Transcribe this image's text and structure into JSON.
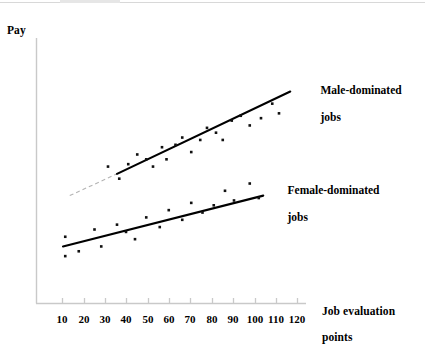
{
  "figure": {
    "y_axis_label": "Pay",
    "x_axis_title_line1": "Job evaluation",
    "x_axis_title_line2": "points"
  },
  "series_labels": {
    "male_line1": "Male-dominated",
    "male_line2": "jobs",
    "female_line1": "Female-dominated",
    "female_line2": "jobs"
  },
  "ticks": [
    {
      "label": "10",
      "x": 62
    },
    {
      "label": "20",
      "x": 84
    },
    {
      "label": "30",
      "x": 105
    },
    {
      "label": "40",
      "x": 126
    },
    {
      "label": "50",
      "x": 148
    },
    {
      "label": "60",
      "x": 169
    },
    {
      "label": "70",
      "x": 190
    },
    {
      "label": "80",
      "x": 212
    },
    {
      "label": "90",
      "x": 233
    },
    {
      "label": "100",
      "x": 255
    },
    {
      "label": "110",
      "x": 276
    },
    {
      "label": "120",
      "x": 297
    }
  ],
  "colors": {
    "axis": "#c9c9c9",
    "ink": "#000000",
    "dashed_extension": "#b4b4b4",
    "background": "#ffffff",
    "top_rule": "#d8d8d8"
  },
  "chart_data": {
    "type": "scatter",
    "title": "",
    "xlabel": "Job evaluation points",
    "ylabel": "Pay",
    "xlim": [
      5,
      125
    ],
    "ylim": [
      0,
      100
    ],
    "grid": false,
    "legend": "inline-annotations",
    "axis_values_shown": false,
    "xticks": [
      10,
      20,
      30,
      40,
      50,
      60,
      70,
      80,
      90,
      100,
      110,
      120
    ],
    "series": [
      {
        "name": "Male-dominated jobs",
        "marker": "square",
        "trendline": {
          "type": "linear",
          "solid_segment": {
            "x1": 41,
            "y1": 48,
            "x2": 118,
            "y2": 82
          },
          "dashed_extension": {
            "x1": 20,
            "y1": 39,
            "x2": 41,
            "y2": 48
          }
        },
        "points": [
          {
            "x": 37,
            "y": 51
          },
          {
            "x": 42,
            "y": 46
          },
          {
            "x": 46,
            "y": 52
          },
          {
            "x": 50,
            "y": 56
          },
          {
            "x": 54,
            "y": 54
          },
          {
            "x": 57,
            "y": 51
          },
          {
            "x": 61,
            "y": 59
          },
          {
            "x": 63,
            "y": 54
          },
          {
            "x": 67,
            "y": 60
          },
          {
            "x": 70,
            "y": 63
          },
          {
            "x": 74,
            "y": 57
          },
          {
            "x": 78,
            "y": 62
          },
          {
            "x": 81,
            "y": 67
          },
          {
            "x": 85,
            "y": 65
          },
          {
            "x": 88,
            "y": 62
          },
          {
            "x": 92,
            "y": 70
          },
          {
            "x": 96,
            "y": 72
          },
          {
            "x": 100,
            "y": 68
          },
          {
            "x": 105,
            "y": 71
          },
          {
            "x": 110,
            "y": 77
          },
          {
            "x": 113,
            "y": 73
          }
        ]
      },
      {
        "name": "Female-dominated jobs",
        "marker": "square",
        "trendline": {
          "type": "linear",
          "solid_segment": {
            "x1": 17,
            "y1": 18,
            "x2": 106,
            "y2": 39
          }
        },
        "points": [
          {
            "x": 18,
            "y": 22
          },
          {
            "x": 18,
            "y": 14
          },
          {
            "x": 24,
            "y": 16
          },
          {
            "x": 31,
            "y": 25
          },
          {
            "x": 34,
            "y": 18
          },
          {
            "x": 41,
            "y": 27
          },
          {
            "x": 45,
            "y": 24
          },
          {
            "x": 49,
            "y": 21
          },
          {
            "x": 54,
            "y": 30
          },
          {
            "x": 60,
            "y": 26
          },
          {
            "x": 64,
            "y": 33
          },
          {
            "x": 70,
            "y": 29
          },
          {
            "x": 74,
            "y": 36
          },
          {
            "x": 79,
            "y": 32
          },
          {
            "x": 84,
            "y": 35
          },
          {
            "x": 89,
            "y": 41
          },
          {
            "x": 93,
            "y": 37
          },
          {
            "x": 100,
            "y": 44
          },
          {
            "x": 104,
            "y": 38
          }
        ]
      }
    ]
  },
  "plot_geometry": {
    "axis_x": 36,
    "axis_y_top": 38,
    "axis_y_bottom": 303,
    "axis_x_right": 306,
    "tick_len": 5,
    "tick_label_y": 313
  }
}
